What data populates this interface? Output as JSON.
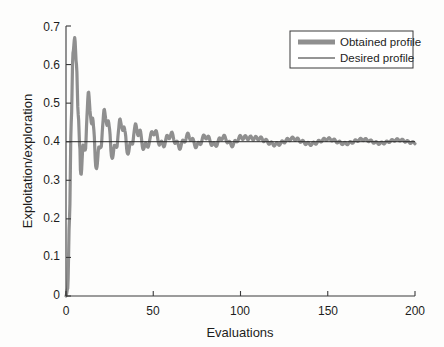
{
  "figure": {
    "background_color": "#fdfdfc",
    "axes_color": "#3a3a3a"
  },
  "chart_data": {
    "type": "line",
    "title": "",
    "xlabel": "Evaluations",
    "ylabel": "Exploitation/exploration",
    "xlim": [
      0,
      200
    ],
    "ylim": [
      0,
      0.7
    ],
    "xticks": [
      0,
      50,
      100,
      150,
      200
    ],
    "xticklabels": [
      "0",
      "50",
      "100",
      "150",
      "200"
    ],
    "yticks": [
      0,
      0.1,
      0.2,
      0.3,
      0.4,
      0.5,
      0.6,
      0.7
    ],
    "yticklabels": [
      "0",
      "0.1",
      "0.2",
      "0.3",
      "0.4",
      "0.5",
      "0.6",
      "0.7"
    ],
    "grid": false,
    "legend_position": "top-right",
    "series": [
      {
        "name": "Obtained profile",
        "color": "#8f8f8f",
        "linewidth": 3.2,
        "style": "solid",
        "description": "Damped oscillation: rises from 0 to peak 0.67 near x=5, dips to 0.325, then oscillates with decaying amplitude converging on 0.4",
        "x": [
          0,
          1,
          2,
          3,
          4,
          5,
          6,
          7,
          8,
          9,
          10,
          11,
          12,
          13,
          14,
          15,
          16,
          17,
          18,
          19,
          20,
          21,
          22,
          23,
          24,
          25,
          26,
          27,
          28,
          29,
          30,
          31,
          32,
          33,
          34,
          35,
          36,
          37,
          38,
          39,
          40,
          42,
          44,
          46,
          48,
          50,
          55,
          60,
          65,
          70,
          75,
          80,
          85,
          90,
          95,
          100,
          110,
          120,
          130,
          140,
          150,
          160,
          170,
          180,
          190,
          200
        ],
        "values": [
          0.0,
          0.02,
          0.2,
          0.45,
          0.63,
          0.67,
          0.6,
          0.47,
          0.38,
          0.33,
          0.355,
          0.41,
          0.465,
          0.5,
          0.495,
          0.455,
          0.405,
          0.36,
          0.345,
          0.365,
          0.405,
          0.44,
          0.465,
          0.47,
          0.45,
          0.415,
          0.38,
          0.365,
          0.375,
          0.4,
          0.425,
          0.445,
          0.45,
          0.435,
          0.41,
          0.385,
          0.375,
          0.385,
          0.405,
          0.425,
          0.435,
          0.425,
          0.392,
          0.385,
          0.405,
          0.428,
          0.392,
          0.418,
          0.388,
          0.415,
          0.39,
          0.414,
          0.391,
          0.412,
          0.392,
          0.411,
          0.409,
          0.393,
          0.408,
          0.394,
          0.407,
          0.395,
          0.406,
          0.396,
          0.405,
          0.397
        ]
      },
      {
        "name": "Desired profile",
        "color": "#2a2a2a",
        "linewidth": 1.0,
        "style": "solid",
        "description": "Constant reference level",
        "constant_value": 0.4,
        "x": [
          0,
          200
        ],
        "values": [
          0.4,
          0.4
        ]
      }
    ]
  },
  "legend": {
    "entries": [
      {
        "label": "Obtained profile",
        "swatch": "thick-gray-line"
      },
      {
        "label": "Desired profile",
        "swatch": "thin-black-line"
      }
    ]
  }
}
